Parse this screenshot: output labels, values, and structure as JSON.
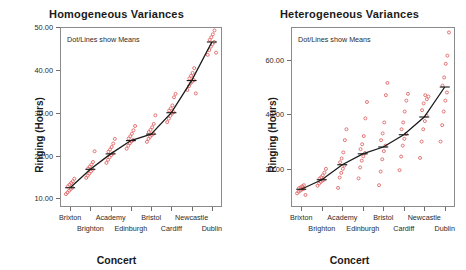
{
  "figure": {
    "xlabel": "Concert",
    "ylabel": "Ringing (Hours)",
    "annotation": "Dot/Lines show Means",
    "point_color": "#e06666",
    "line_color": "#1a1a1a"
  },
  "chart_data": [
    {
      "type": "scatter",
      "title": "Homogeneous Variances",
      "xlabel": "Concert",
      "ylabel": "Ringing (Hours)",
      "annotation": "Dot/Lines show Means",
      "grid": false,
      "legend": "none",
      "categories": [
        "Brixton",
        "Brighton",
        "Academy",
        "Edinburgh",
        "Bristol",
        "Cardiff",
        "Newcastle",
        "Dublin"
      ],
      "ylim": [
        8.0,
        50.0
      ],
      "yticks": [
        10.0,
        20.0,
        30.0,
        40.0,
        50.0
      ],
      "ytick_labels": [
        "10.00",
        "20.00",
        "30.00",
        "40.00",
        "50.00"
      ],
      "series": [
        {
          "name": "Mean",
          "values": [
            12.5,
            16.8,
            20.4,
            23.5,
            25.0,
            30.0,
            37.5,
            46.5
          ]
        }
      ],
      "points": [
        {
          "category": "Brixton",
          "values": [
            11.0,
            11.4,
            11.8,
            12.2,
            12.5,
            12.8,
            13.2,
            13.6,
            14.0,
            14.6
          ]
        },
        {
          "category": "Brighton",
          "values": [
            14.8,
            15.3,
            15.8,
            16.3,
            16.7,
            17.0,
            17.4,
            17.9,
            18.5,
            21.0
          ]
        },
        {
          "category": "Academy",
          "values": [
            18.3,
            19.0,
            19.6,
            20.1,
            20.5,
            20.9,
            21.4,
            22.0,
            22.8,
            23.9
          ]
        },
        {
          "category": "Edinburgh",
          "values": [
            21.6,
            22.3,
            22.9,
            23.3,
            23.6,
            24.0,
            24.5,
            25.1,
            25.9,
            26.9
          ]
        },
        {
          "category": "Bristol",
          "values": [
            23.2,
            23.9,
            24.4,
            24.8,
            25.1,
            25.5,
            26.0,
            26.6,
            27.4,
            29.4
          ]
        },
        {
          "category": "Cardiff",
          "values": [
            27.8,
            28.6,
            29.3,
            29.8,
            30.1,
            30.5,
            31.0,
            31.7,
            33.6,
            34.4
          ]
        },
        {
          "category": "Newcastle",
          "values": [
            35.3,
            36.2,
            36.9,
            37.3,
            37.6,
            38.0,
            38.6,
            39.3,
            40.4,
            34.5
          ]
        },
        {
          "category": "Dublin",
          "values": [
            43.5,
            44.6,
            45.4,
            46.0,
            46.5,
            47.0,
            47.6,
            48.3,
            49.2,
            44.0
          ]
        }
      ]
    },
    {
      "type": "scatter",
      "title": "Heterogeneous Variances",
      "xlabel": "Concert",
      "ylabel": "Ringing (Hours)",
      "annotation": "Dot/Lines show Means",
      "grid": false,
      "legend": "none",
      "categories": [
        "Brixton",
        "Brighton",
        "Academy",
        "Edinburgh",
        "Bristol",
        "Cardiff",
        "Newcastle",
        "Dublin"
      ],
      "ylim": [
        6.0,
        72.0
      ],
      "yticks": [
        20.0,
        40.0,
        60.0
      ],
      "ytick_labels": [
        "20.00",
        "40.00",
        "60.00"
      ],
      "series": [
        {
          "name": "Mean",
          "values": [
            12.5,
            16.0,
            21.5,
            25.5,
            28.0,
            32.5,
            39.0,
            50.0
          ]
        }
      ],
      "points": [
        {
          "category": "Brixton",
          "values": [
            11.0,
            11.6,
            12.0,
            12.4,
            12.6,
            12.9,
            13.2,
            13.6,
            14.0,
            10.4
          ]
        },
        {
          "category": "Brighton",
          "values": [
            13.8,
            14.6,
            15.2,
            15.7,
            16.0,
            16.4,
            16.9,
            17.6,
            18.6,
            20.0
          ]
        },
        {
          "category": "Academy",
          "values": [
            13.0,
            16.8,
            18.5,
            20.0,
            21.2,
            22.4,
            23.8,
            26.0,
            30.5,
            34.5
          ]
        },
        {
          "category": "Edinburgh",
          "values": [
            16.5,
            20.5,
            23.0,
            24.6,
            25.8,
            27.2,
            29.0,
            32.0,
            38.5,
            44.5
          ]
        },
        {
          "category": "Bristol",
          "values": [
            14.0,
            19.0,
            23.5,
            26.5,
            28.5,
            30.5,
            33.0,
            37.0,
            47.0,
            51.5
          ]
        },
        {
          "category": "Cardiff",
          "values": [
            19.5,
            24.5,
            28.5,
            31.0,
            32.8,
            34.5,
            37.0,
            41.0,
            45.0,
            47.5
          ]
        },
        {
          "category": "Newcastle",
          "values": [
            24.0,
            30.0,
            34.5,
            37.5,
            39.5,
            41.5,
            44.0,
            47.0,
            45.5,
            46.5
          ]
        },
        {
          "category": "Dublin",
          "values": [
            30.0,
            36.0,
            41.0,
            45.0,
            48.0,
            50.5,
            53.5,
            58.5,
            61.5,
            70.0
          ]
        }
      ]
    }
  ]
}
